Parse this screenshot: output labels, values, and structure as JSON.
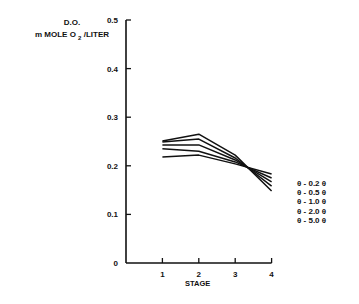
{
  "chart_data": {
    "type": "line",
    "title": "",
    "ylabel": "D.O. m MOLE O2/LITER",
    "ylabel_line1": "D.O.",
    "ylabel_line2_pre": "m MOLE O",
    "ylabel_line2_sub": "2",
    "ylabel_line2_post": "/LITER",
    "xlabel": "STAGE",
    "x": [
      1,
      2,
      3,
      4
    ],
    "x_tick_labels": [
      "1",
      "2",
      "3",
      "4"
    ],
    "y_tick_labels": [
      "0",
      "0.1",
      "0.2",
      "0.3",
      "0.4",
      "0.5"
    ],
    "ylim": [
      0,
      0.5
    ],
    "xlim": [
      0,
      4
    ],
    "grid": false,
    "legend_position": "right",
    "series": [
      {
        "name": "θ - 0.2 θ",
        "values": [
          0.218,
          0.222,
          0.204,
          0.183
        ]
      },
      {
        "name": "θ - 0.5 θ",
        "values": [
          0.235,
          0.23,
          0.208,
          0.175
        ]
      },
      {
        "name": "θ - 1.0 θ",
        "values": [
          0.243,
          0.243,
          0.212,
          0.167
        ]
      },
      {
        "name": "θ - 2.0 θ",
        "values": [
          0.249,
          0.255,
          0.216,
          0.158
        ]
      },
      {
        "name": "θ - 5.0 θ",
        "values": [
          0.251,
          0.265,
          0.222,
          0.148
        ]
      }
    ],
    "line_color": "#111111"
  }
}
